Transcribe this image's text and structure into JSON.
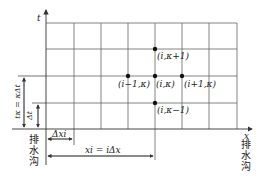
{
  "diagram": {
    "type": "finite-difference grid",
    "axes": {
      "vertical": "t",
      "horizontal": "x"
    },
    "grid": {
      "columns": 7,
      "rows": 4
    },
    "nodes": [
      {
        "label": "(i,κ+1)"
      },
      {
        "label": "(i−1,κ)"
      },
      {
        "label": "(i,κ)"
      },
      {
        "label": "(i+1,κ)"
      },
      {
        "label": "(i,κ−1)"
      }
    ],
    "dimensions": {
      "tk": "tκ = κΔt",
      "dt": "Δt",
      "dxi": "Δxi",
      "xi": "xi = iΔx"
    },
    "left_boundary": [
      "排",
      "水",
      "沟"
    ],
    "right_boundary": [
      "排",
      "水",
      "沟"
    ],
    "line_color": "#555555",
    "node_color": "#111111"
  }
}
